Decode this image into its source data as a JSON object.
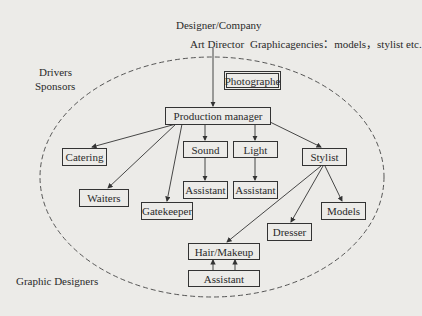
{
  "top_labels": {
    "designer": "Designer/Company",
    "art_director": "Art Director",
    "agencies": "Graphicagencies：models，stylist etc.",
    "drivers": "Drivers",
    "sponsors": "Sponsors",
    "graphic_designers": "Graphic Designers"
  },
  "nodes": {
    "photographe": "Photographe",
    "production_manager": "Production manager",
    "catering": "Catering",
    "waiters": "Waiters",
    "gatekeeper": "Gatekeeper",
    "sound": "Sound",
    "light": "Light",
    "sound_assistant": "Assistant",
    "light_assistant": "Assistant",
    "stylist": "Stylist",
    "models": "Models",
    "dresser": "Dresser",
    "hair_makeup": "Hair/Makeup",
    "hair_assistant": "Assistant"
  },
  "colors": {
    "background": "#ecebe8",
    "stroke": "#333333"
  }
}
